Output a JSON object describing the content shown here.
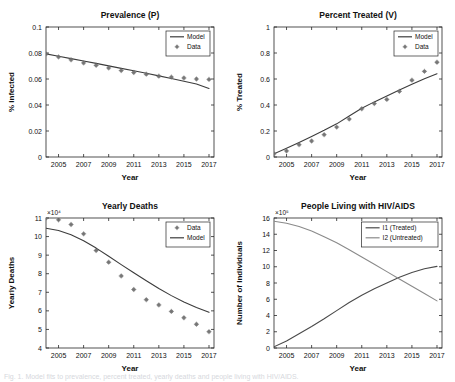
{
  "figure": {
    "background": "#ffffff",
    "axis_color": "#262626",
    "model_color": "#3c3c3c",
    "data_marker_color": "#6e6e6e",
    "i1_color": "#4a4a4a",
    "i2_color": "#8a8a8a",
    "caption_partial": "Fig. 1. Model fits to prevalence, percent treated, yearly deaths and people living with HIV/AIDS."
  },
  "chart_data": [
    {
      "id": "prevalence",
      "type": "line",
      "title": "Prevalence (P)",
      "xlabel": "Year",
      "ylabel": "% Infected",
      "xlim": [
        2004,
        2017.4
      ],
      "ylim": [
        0,
        0.1
      ],
      "xticks": [
        2005,
        2007,
        2009,
        2011,
        2013,
        2015,
        2017
      ],
      "xticklabels": [
        "2005",
        "2007",
        "2009",
        "2011",
        "2013",
        "2015",
        "2017"
      ],
      "yticks": [
        0,
        0.02,
        0.04,
        0.06,
        0.08,
        0.1
      ],
      "yticklabels": [
        "0",
        "0.02",
        "0.04",
        "0.06",
        "0.08",
        "0.1"
      ],
      "grid": false,
      "legend_position": "top-right",
      "legend": [
        "Model",
        "Data"
      ],
      "series": [
        {
          "name": "Model",
          "style": "line",
          "x": [
            2004,
            2005,
            2006,
            2007,
            2008,
            2009,
            2010,
            2011,
            2012,
            2013,
            2014,
            2015,
            2016,
            2017
          ],
          "values": [
            0.0793,
            0.0775,
            0.0757,
            0.0738,
            0.072,
            0.0701,
            0.0682,
            0.0663,
            0.0644,
            0.0624,
            0.0604,
            0.0583,
            0.0562,
            0.0527
          ]
        },
        {
          "name": "Data",
          "style": "marker",
          "x": [
            2004,
            2005,
            2006,
            2007,
            2008,
            2009,
            2010,
            2011,
            2012,
            2013,
            2014,
            2015,
            2016,
            2017
          ],
          "values": [
            0.0793,
            0.077,
            0.0748,
            0.0724,
            0.0705,
            0.0685,
            0.0665,
            0.065,
            0.0637,
            0.0622,
            0.0615,
            0.0608,
            0.06,
            0.0597
          ]
        }
      ]
    },
    {
      "id": "percent-treated",
      "type": "line",
      "title": "Percent Treated (V)",
      "xlabel": "Year",
      "ylabel": "% Treated",
      "xlim": [
        2004,
        2017.4
      ],
      "ylim": [
        0,
        1
      ],
      "xticks": [
        2005,
        2007,
        2009,
        2011,
        2013,
        2015,
        2017
      ],
      "xticklabels": [
        "2005",
        "2007",
        "2009",
        "2011",
        "2013",
        "2015",
        "2017"
      ],
      "yticks": [
        0,
        0.2,
        0.4,
        0.6,
        0.8,
        1
      ],
      "yticklabels": [
        "0",
        "0.2",
        "0.4",
        "0.6",
        "0.8",
        "1"
      ],
      "grid": false,
      "legend_position": "top-right",
      "legend": [
        "Model",
        "Data"
      ],
      "series": [
        {
          "name": "Model",
          "style": "line",
          "x": [
            2004,
            2005,
            2006,
            2007,
            2008,
            2009,
            2010,
            2011,
            2012,
            2013,
            2014,
            2015,
            2016,
            2017
          ],
          "values": [
            0.025,
            0.068,
            0.112,
            0.158,
            0.205,
            0.255,
            0.315,
            0.375,
            0.424,
            0.47,
            0.516,
            0.56,
            0.602,
            0.64
          ]
        },
        {
          "name": "Data",
          "style": "marker",
          "x": [
            2004,
            2005,
            2006,
            2007,
            2008,
            2009,
            2010,
            2011,
            2012,
            2013,
            2014,
            2015,
            2016,
            2017
          ],
          "values": [
            0.025,
            0.047,
            0.095,
            0.123,
            0.172,
            0.23,
            0.292,
            0.371,
            0.411,
            0.443,
            0.505,
            0.591,
            0.659,
            0.729
          ]
        }
      ]
    },
    {
      "id": "yearly-deaths",
      "type": "line",
      "title": "Yearly Deaths",
      "xlabel": "Year",
      "ylabel": "Yearly Deaths",
      "y_exponent_label": "×10⁴",
      "xlim": [
        2004,
        2017.4
      ],
      "ylim": [
        4,
        11
      ],
      "xticks": [
        2005,
        2007,
        2009,
        2011,
        2013,
        2015,
        2017
      ],
      "xticklabels": [
        "2005",
        "2007",
        "2009",
        "2011",
        "2013",
        "2015",
        "2017"
      ],
      "yticks": [
        4,
        5,
        6,
        7,
        8,
        9,
        10,
        11
      ],
      "yticklabels": [
        "4",
        "5",
        "6",
        "7",
        "8",
        "9",
        "10",
        "11"
      ],
      "grid": false,
      "legend_position": "top-right",
      "legend": [
        "Data",
        "Model"
      ],
      "series": [
        {
          "name": "Data",
          "style": "marker",
          "x": [
            2004,
            2005,
            2006,
            2007,
            2008,
            2009,
            2010,
            2011,
            2012,
            2013,
            2014,
            2015,
            2016,
            2017
          ],
          "values": [
            11.0,
            10.9,
            10.65,
            10.15,
            9.25,
            8.62,
            7.88,
            7.15,
            6.6,
            6.32,
            5.97,
            5.63,
            5.28,
            4.88
          ]
        },
        {
          "name": "Model",
          "style": "line",
          "x": [
            2004,
            2005,
            2006,
            2007,
            2008,
            2009,
            2010,
            2011,
            2012,
            2013,
            2014,
            2015,
            2016,
            2017
          ],
          "values": [
            10.45,
            10.33,
            10.1,
            9.78,
            9.38,
            8.94,
            8.49,
            8.05,
            7.62,
            7.2,
            6.82,
            6.48,
            6.18,
            5.92
          ]
        }
      ]
    },
    {
      "id": "people-living-with-hiv",
      "type": "line",
      "title": "People Living with HIV/AIDS",
      "xlabel": "Year",
      "ylabel": "Number of Individuals",
      "y_exponent_label": "×10⁵",
      "xlim": [
        2004,
        2017.4
      ],
      "ylim": [
        0,
        16
      ],
      "xticks": [
        2005,
        2007,
        2009,
        2011,
        2013,
        2015,
        2017
      ],
      "xticklabels": [
        "2005",
        "2007",
        "2009",
        "2011",
        "2013",
        "2015",
        "2017"
      ],
      "yticks": [
        0,
        2,
        4,
        6,
        8,
        10,
        12,
        14,
        16
      ],
      "yticklabels": [
        "0",
        "2",
        "4",
        "6",
        "8",
        "10",
        "12",
        "14",
        "16"
      ],
      "grid": false,
      "legend_position": "top-right",
      "legend": [
        "I1 (Treated)",
        "I2 (Untreated)"
      ],
      "series": [
        {
          "name": "I1 (Treated)",
          "style": "line",
          "x": [
            2004,
            2005,
            2006,
            2007,
            2008,
            2009,
            2010,
            2011,
            2012,
            2013,
            2014,
            2015,
            2016,
            2017
          ],
          "values": [
            0.15,
            0.85,
            1.75,
            2.65,
            3.6,
            4.6,
            5.6,
            6.5,
            7.3,
            8.0,
            8.7,
            9.3,
            9.75,
            10.05
          ]
        },
        {
          "name": "I2 (Untreated)",
          "style": "line",
          "x": [
            2004,
            2005,
            2006,
            2007,
            2008,
            2009,
            2010,
            2011,
            2012,
            2013,
            2014,
            2015,
            2016,
            2017
          ],
          "values": [
            15.6,
            15.35,
            14.95,
            14.4,
            13.7,
            12.95,
            12.1,
            11.2,
            10.3,
            9.4,
            8.5,
            7.6,
            6.7,
            5.8
          ]
        }
      ]
    }
  ]
}
